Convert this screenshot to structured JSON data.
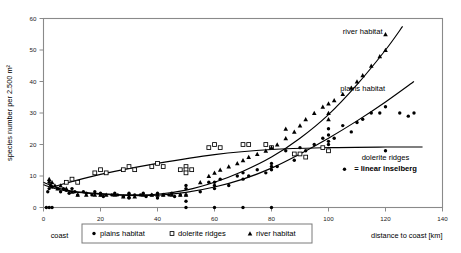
{
  "chart_data": {
    "type": "scatter",
    "title": "",
    "xlabel": "distance to coast [km]",
    "ylabel": "species number per 2.500 m²",
    "xlim": [
      0,
      140
    ],
    "ylim": [
      0,
      60
    ],
    "xticks": [
      0,
      20,
      40,
      60,
      80,
      100,
      120,
      140
    ],
    "yticks": [
      0,
      10,
      20,
      30,
      40,
      50,
      60
    ],
    "grid": false,
    "origin_label": "coast",
    "legend_position": "bottom",
    "legend": [
      {
        "label": "plains habitat",
        "marker": "filled-circle"
      },
      {
        "label": "dolerite ridges",
        "marker": "open-square"
      },
      {
        "label": "river habitat",
        "marker": "filled-triangle"
      }
    ],
    "annotations": [
      {
        "text": "river habitat",
        "x": 112,
        "y": 55
      },
      {
        "text": "plains habitat",
        "x": 112,
        "y": 37
      },
      {
        "text": "dolerite ridges",
        "x": 120,
        "y": 15
      },
      {
        "text": "= linear inselberg",
        "x": 120,
        "y": 11.5
      }
    ],
    "series": [
      {
        "name": "plains habitat",
        "marker": "filled-circle",
        "points": [
          [
            1,
            0
          ],
          [
            2,
            0
          ],
          [
            3,
            0
          ],
          [
            1.5,
            5
          ],
          [
            2,
            6
          ],
          [
            2.5,
            7
          ],
          [
            3,
            6.5
          ],
          [
            2,
            8
          ],
          [
            5,
            6
          ],
          [
            6,
            5
          ],
          [
            7,
            6
          ],
          [
            8,
            5.5
          ],
          [
            9,
            4.5
          ],
          [
            10,
            6
          ],
          [
            11,
            5
          ],
          [
            12,
            4
          ],
          [
            14,
            5
          ],
          [
            15,
            4.5
          ],
          [
            17,
            4
          ],
          [
            18,
            5
          ],
          [
            20,
            4
          ],
          [
            20,
            4.5
          ],
          [
            21,
            3.5
          ],
          [
            24,
            4
          ],
          [
            25,
            4.5
          ],
          [
            26,
            4
          ],
          [
            28,
            3.5
          ],
          [
            30,
            4
          ],
          [
            30,
            4.5
          ],
          [
            30,
            3
          ],
          [
            32,
            4
          ],
          [
            34,
            4
          ],
          [
            35,
            4.5
          ],
          [
            36,
            3.5
          ],
          [
            38,
            4
          ],
          [
            40,
            4
          ],
          [
            40,
            4.5
          ],
          [
            40,
            3
          ],
          [
            42,
            4
          ],
          [
            44,
            4
          ],
          [
            45,
            4.5
          ],
          [
            46,
            3.5
          ],
          [
            48,
            4
          ],
          [
            50,
            4
          ],
          [
            50,
            0
          ],
          [
            50,
            2
          ],
          [
            50,
            6
          ],
          [
            50,
            7
          ],
          [
            55,
            5
          ],
          [
            58,
            8
          ],
          [
            60,
            6
          ],
          [
            60,
            7
          ],
          [
            60,
            8
          ],
          [
            60,
            0
          ],
          [
            62,
            9
          ],
          [
            65,
            7
          ],
          [
            68,
            10
          ],
          [
            70,
            9
          ],
          [
            70,
            11
          ],
          [
            70,
            0
          ],
          [
            72,
            10
          ],
          [
            75,
            12
          ],
          [
            78,
            11
          ],
          [
            80,
            13
          ],
          [
            80,
            12
          ],
          [
            80,
            14
          ],
          [
            80,
            0
          ],
          [
            82,
            13
          ],
          [
            85,
            18
          ],
          [
            88,
            15
          ],
          [
            90,
            17
          ],
          [
            90,
            19
          ],
          [
            92,
            18
          ],
          [
            95,
            20
          ],
          [
            98,
            22
          ],
          [
            100,
            21
          ],
          [
            100,
            23
          ],
          [
            100,
            25
          ],
          [
            100,
            18
          ],
          [
            100,
            20
          ],
          [
            102,
            22
          ],
          [
            105,
            26
          ],
          [
            108,
            24
          ],
          [
            110,
            27
          ],
          [
            112,
            28
          ],
          [
            115,
            30
          ],
          [
            118,
            30
          ],
          [
            120,
            32
          ],
          [
            120,
            18
          ],
          [
            125,
            30
          ],
          [
            128,
            29
          ],
          [
            130,
            30
          ]
        ]
      },
      {
        "name": "dolerite ridges",
        "marker": "open-square",
        "points": [
          [
            8,
            8
          ],
          [
            10,
            9
          ],
          [
            12,
            8
          ],
          [
            18,
            11
          ],
          [
            20,
            12
          ],
          [
            22,
            11
          ],
          [
            28,
            12
          ],
          [
            30,
            13
          ],
          [
            32,
            12
          ],
          [
            38,
            13
          ],
          [
            40,
            14
          ],
          [
            42,
            13
          ],
          [
            48,
            12
          ],
          [
            50,
            13
          ],
          [
            50,
            12
          ],
          [
            52,
            12
          ],
          [
            50,
            11
          ],
          [
            58,
            19
          ],
          [
            60,
            20
          ],
          [
            62,
            19
          ],
          [
            70,
            20
          ],
          [
            72,
            20
          ],
          [
            78,
            20
          ],
          [
            80,
            19
          ],
          [
            88,
            17
          ],
          [
            90,
            17
          ],
          [
            92,
            16
          ],
          [
            98,
            19
          ],
          [
            100,
            18
          ]
        ]
      },
      {
        "name": "river habitat",
        "marker": "filled-triangle",
        "points": [
          [
            2,
            9
          ],
          [
            3,
            8
          ],
          [
            4,
            7
          ],
          [
            5,
            6
          ],
          [
            6,
            7
          ],
          [
            8,
            6
          ],
          [
            10,
            5
          ],
          [
            12,
            4
          ],
          [
            15,
            4
          ],
          [
            18,
            4
          ],
          [
            20,
            4
          ],
          [
            22,
            4
          ],
          [
            25,
            4
          ],
          [
            28,
            3.5
          ],
          [
            30,
            3.5
          ],
          [
            32,
            3.5
          ],
          [
            35,
            4
          ],
          [
            38,
            4
          ],
          [
            40,
            4
          ],
          [
            42,
            4
          ],
          [
            45,
            4
          ],
          [
            48,
            4
          ],
          [
            50,
            4
          ],
          [
            55,
            8
          ],
          [
            58,
            10
          ],
          [
            60,
            11
          ],
          [
            62,
            12
          ],
          [
            65,
            13
          ],
          [
            68,
            14
          ],
          [
            70,
            15
          ],
          [
            72,
            16
          ],
          [
            75,
            17
          ],
          [
            78,
            18
          ],
          [
            80,
            19
          ],
          [
            82,
            20
          ],
          [
            85,
            22
          ],
          [
            85,
            25
          ],
          [
            88,
            24
          ],
          [
            90,
            26
          ],
          [
            92,
            28
          ],
          [
            95,
            30
          ],
          [
            98,
            32
          ],
          [
            100,
            30
          ],
          [
            100,
            28
          ],
          [
            100,
            33
          ],
          [
            102,
            34
          ],
          [
            105,
            36
          ],
          [
            108,
            38
          ],
          [
            110,
            40
          ],
          [
            112,
            42
          ],
          [
            115,
            45
          ],
          [
            118,
            48
          ],
          [
            120,
            50
          ],
          [
            120,
            55
          ]
        ]
      }
    ],
    "trendlines": [
      {
        "name": "river habitat",
        "path": [
          [
            0,
            8
          ],
          [
            5,
            6.2
          ],
          [
            10,
            5.2
          ],
          [
            20,
            4.4
          ],
          [
            30,
            4.0
          ],
          [
            40,
            4.2
          ],
          [
            50,
            5.5
          ],
          [
            60,
            8.0
          ],
          [
            70,
            11.5
          ],
          [
            80,
            16.0
          ],
          [
            90,
            22.0
          ],
          [
            100,
            29.5
          ],
          [
            110,
            39.0
          ],
          [
            120,
            50.0
          ],
          [
            126,
            57.5
          ]
        ]
      },
      {
        "name": "plains habitat",
        "path": [
          [
            0,
            7.2
          ],
          [
            5,
            5.8
          ],
          [
            10,
            5.0
          ],
          [
            20,
            4.2
          ],
          [
            30,
            3.8
          ],
          [
            40,
            3.9
          ],
          [
            50,
            4.8
          ],
          [
            60,
            6.5
          ],
          [
            70,
            9.0
          ],
          [
            80,
            12.5
          ],
          [
            90,
            17.0
          ],
          [
            100,
            22.0
          ],
          [
            110,
            27.5
          ],
          [
            120,
            33.5
          ],
          [
            130,
            40.0
          ]
        ]
      },
      {
        "name": "dolerite ridges",
        "path": [
          [
            3,
            6.5
          ],
          [
            20,
            10.5
          ],
          [
            40,
            14.0
          ],
          [
            60,
            16.8
          ],
          [
            80,
            18.4
          ],
          [
            100,
            19.0
          ],
          [
            120,
            19.2
          ],
          [
            133,
            19.2
          ]
        ]
      }
    ]
  }
}
